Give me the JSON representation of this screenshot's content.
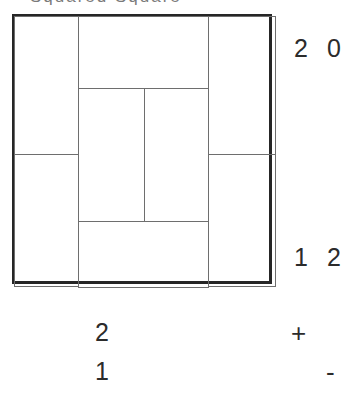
{
  "figure": {
    "title_clipped": "Squared Square",
    "caption_note": "top caption cropped by frame edge"
  },
  "diagram": {
    "kind": "squared-square-dissection",
    "outer": {
      "x": 12,
      "y": 14,
      "width": 260,
      "height": 270
    },
    "cells": [
      {
        "name": "left-upper",
        "x": 0,
        "y": 0,
        "width": 64,
        "height": 138
      },
      {
        "name": "left-lower",
        "x": 0,
        "y": 138,
        "width": 64,
        "height": 132
      },
      {
        "name": "center-top",
        "x": 64,
        "y": 0,
        "width": 129,
        "height": 71
      },
      {
        "name": "center-mid-left",
        "x": 64,
        "y": 71,
        "width": 65,
        "height": 133
      },
      {
        "name": "center-mid-right",
        "x": 129,
        "y": 71,
        "width": 64,
        "height": 133
      },
      {
        "name": "center-bottom",
        "x": 64,
        "y": 204,
        "width": 129,
        "height": 66
      },
      {
        "name": "right-upper",
        "x": 193,
        "y": 0,
        "width": 67,
        "height": 138
      },
      {
        "name": "right-lower",
        "x": 193,
        "y": 138,
        "width": 67,
        "height": 132
      }
    ]
  },
  "labels": {
    "top_right_first": "2",
    "top_right_second": "0",
    "bottom_right_first": "1",
    "bottom_right_second": "2",
    "below_first": "2",
    "below_second": "1",
    "operator_plus": "+",
    "operator_minus": "-"
  },
  "colors": {
    "outer_border": "#262626",
    "inner_line": "#6e6e6e",
    "text": "#2b2b2b",
    "caption": "#7a7a7a",
    "background": "#ffffff"
  }
}
